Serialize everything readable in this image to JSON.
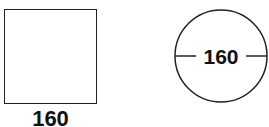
{
  "shapes": {
    "square": {
      "label": "160",
      "dimension": "side length"
    },
    "circle": {
      "label": "160",
      "dimension": "diameter"
    }
  },
  "colors": {
    "stroke": "#222222",
    "text": "#111111",
    "background": "#ffffff"
  }
}
